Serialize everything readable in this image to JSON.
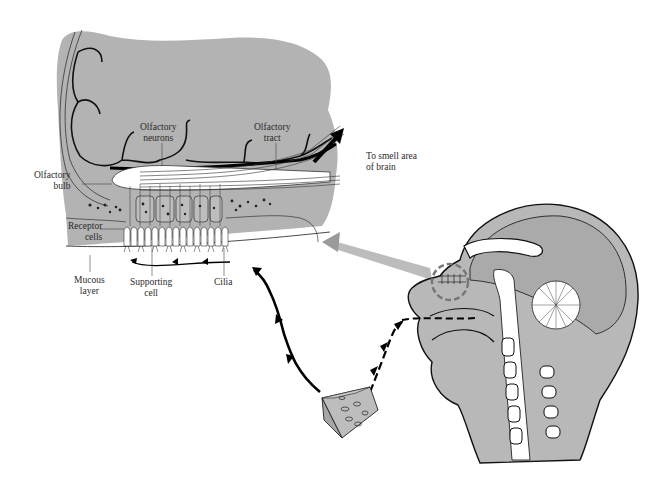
{
  "figure": {
    "colors": {
      "tissue_gray": "#b5b5b5",
      "dark_line": "#1a1a1a",
      "white": "#ffffff",
      "pointer_gray": "#9a9a9a"
    }
  },
  "inset": {
    "labels": {
      "olfactory_neurons": [
        "Olfactory",
        "neurons"
      ],
      "olfactory_tract": [
        "Olfactory",
        "tract"
      ],
      "to_smell_area": [
        "To smell area",
        "of brain"
      ],
      "olfactory_bulb": [
        "Olfactory",
        "bulb"
      ],
      "receptor_cells": [
        "Receptor",
        "cells"
      ],
      "mucous_layer": [
        "Mucous",
        "layer"
      ],
      "supporting_cell": [
        "Supporting",
        "cell"
      ],
      "cilia": [
        "Cilia"
      ]
    }
  },
  "head": {
    "description": "Midsagittal section of human head showing brain, cerebellum, nasal cavity, mouth and spine"
  },
  "odor_source": {
    "description": "Wedge of cheese with holes"
  }
}
